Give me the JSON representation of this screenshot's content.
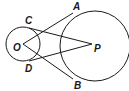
{
  "diagram": {
    "type": "geometry",
    "labels": {
      "A": "A",
      "B": "B",
      "C": "C",
      "D": "D",
      "O": "O",
      "P": "P"
    },
    "circles": [
      {
        "name": "circle-O",
        "cx": 23,
        "cy": 44,
        "r": 17
      },
      {
        "name": "circle-P",
        "cx": 95,
        "cy": 46,
        "r": 35
      }
    ],
    "segments": [
      {
        "name": "segment-OA",
        "from": "O",
        "to": "A"
      },
      {
        "name": "segment-OB",
        "from": "O",
        "to": "B"
      },
      {
        "name": "segment-PC",
        "from": "P",
        "to": "C"
      },
      {
        "name": "segment-PD",
        "from": "P",
        "to": "D"
      }
    ],
    "stroke_color": "#1a1a1a"
  }
}
